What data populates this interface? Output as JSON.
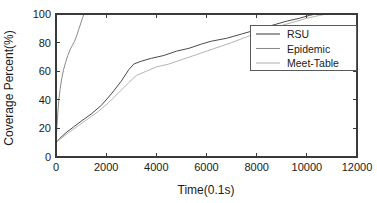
{
  "chart_data": {
    "type": "line",
    "title": "",
    "xlabel": "Time(0.1s)",
    "ylabel": "Coverage Percent(%)",
    "xlim": [
      0,
      12000
    ],
    "ylim": [
      0,
      100
    ],
    "xticks": [
      0,
      2000,
      4000,
      6000,
      8000,
      10000,
      12000
    ],
    "xtick_labels": [
      "0",
      "2000",
      "4000",
      "6000",
      "8000",
      "10000",
      "12000"
    ],
    "yticks": [
      0,
      20,
      40,
      60,
      80,
      100
    ],
    "ytick_labels": [
      "0",
      "20",
      "40",
      "60",
      "80",
      "100"
    ],
    "grid": false,
    "legend_position": "upper right",
    "series": [
      {
        "name": "RSU",
        "color": "#4a4a4a",
        "points": [
          [
            0,
            10
          ],
          [
            150,
            13
          ],
          [
            400,
            17
          ],
          [
            700,
            21
          ],
          [
            1000,
            25
          ],
          [
            1400,
            30
          ],
          [
            1800,
            36
          ],
          [
            2200,
            44
          ],
          [
            2600,
            53
          ],
          [
            2900,
            61
          ],
          [
            3100,
            65
          ],
          [
            3400,
            67
          ],
          [
            3800,
            69
          ],
          [
            4300,
            71
          ],
          [
            4800,
            74
          ],
          [
            5300,
            76
          ],
          [
            5800,
            79
          ],
          [
            6200,
            81
          ],
          [
            6800,
            83
          ],
          [
            7400,
            86
          ],
          [
            8000,
            89
          ],
          [
            8600,
            92
          ],
          [
            9200,
            95
          ],
          [
            9700,
            97
          ],
          [
            10100,
            99
          ],
          [
            10350,
            100
          ],
          [
            12000,
            100
          ]
        ]
      },
      {
        "name": "Epidemic",
        "color": "#8a8a8a",
        "points": [
          [
            0,
            10
          ],
          [
            40,
            22
          ],
          [
            80,
            33
          ],
          [
            120,
            41
          ],
          [
            170,
            48
          ],
          [
            230,
            55
          ],
          [
            300,
            61
          ],
          [
            380,
            66
          ],
          [
            470,
            71
          ],
          [
            560,
            75
          ],
          [
            650,
            78
          ],
          [
            740,
            81
          ],
          [
            830,
            85
          ],
          [
            900,
            89
          ],
          [
            980,
            93
          ],
          [
            1050,
            97
          ],
          [
            1120,
            100
          ],
          [
            12000,
            100
          ]
        ]
      },
      {
        "name": "Meet-Table",
        "color": "#b4b4b4",
        "points": [
          [
            0,
            10
          ],
          [
            200,
            13
          ],
          [
            500,
            17
          ],
          [
            900,
            22
          ],
          [
            1300,
            27
          ],
          [
            1700,
            32
          ],
          [
            2100,
            38
          ],
          [
            2500,
            45
          ],
          [
            2900,
            52
          ],
          [
            3200,
            57
          ],
          [
            3600,
            60
          ],
          [
            4000,
            63
          ],
          [
            4500,
            65
          ],
          [
            5000,
            68
          ],
          [
            5500,
            71
          ],
          [
            6000,
            74
          ],
          [
            6500,
            77
          ],
          [
            7000,
            80
          ],
          [
            7600,
            84
          ],
          [
            8200,
            88
          ],
          [
            8800,
            91
          ],
          [
            9400,
            94
          ],
          [
            10000,
            97
          ],
          [
            10500,
            99
          ],
          [
            10800,
            100
          ],
          [
            12000,
            100
          ]
        ]
      }
    ]
  },
  "legend": {
    "items": [
      {
        "label": "RSU"
      },
      {
        "label": "Epidemic"
      },
      {
        "label": "Meet-Table"
      }
    ]
  }
}
